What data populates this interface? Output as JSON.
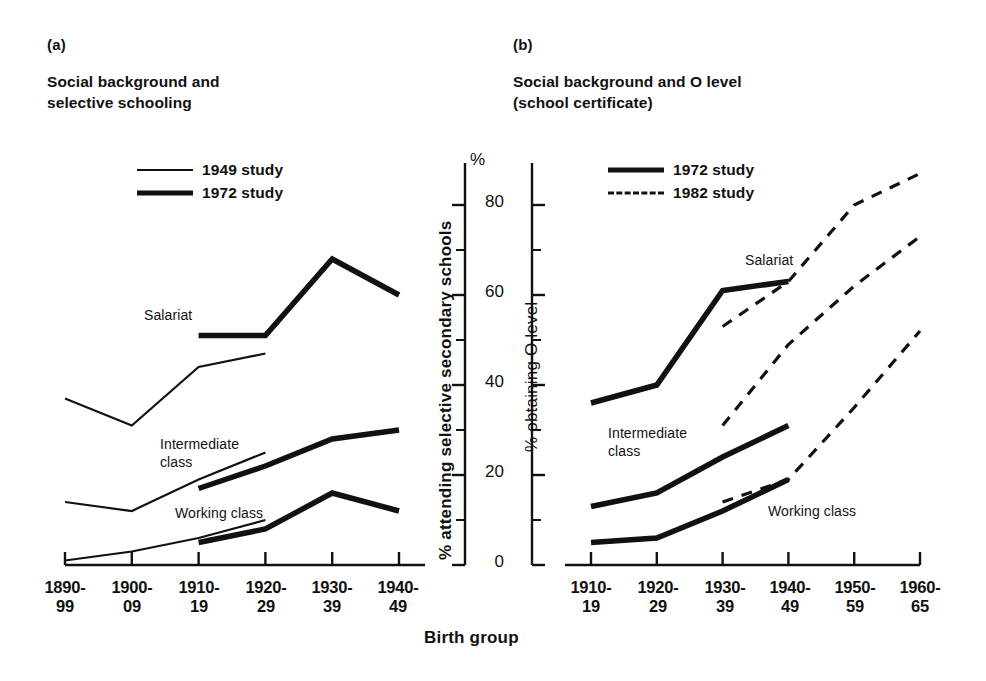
{
  "figure": {
    "shared_xlabel": "Birth group",
    "background": "#ffffff",
    "ink": "#111111"
  },
  "panel_a": {
    "tag": "(a)",
    "title": "Social background and\nselective schooling",
    "legend": [
      {
        "label": "1949 study",
        "style": "thin"
      },
      {
        "label": "1972 study",
        "style": "thick"
      }
    ],
    "series_labels": {
      "salariat": "Salariat",
      "intermediate": "Intermediate\nclass",
      "working": "Working class"
    },
    "ylabel": "% attending selective secondary schools",
    "ytop_symbol": "%",
    "yticks": [
      "0",
      "20",
      "40",
      "60",
      "80"
    ],
    "xticks": [
      "1890-\n99",
      "1900-\n09",
      "1910-\n19",
      "1920-\n29",
      "1930-\n39",
      "1940-\n49"
    ]
  },
  "panel_b": {
    "tag": "(b)",
    "title": "Social background and O level\n(school certificate)",
    "legend": [
      {
        "label": "1972 study",
        "style": "thick"
      },
      {
        "label": "1982 study",
        "style": "dashed"
      }
    ],
    "series_labels": {
      "salariat": "Salariat",
      "intermediate": "Intermediate\nclass",
      "working": "Working class"
    },
    "ylabel": "% obtaining O level",
    "xticks": [
      "1910-\n19",
      "1920-\n29",
      "1930-\n39",
      "1940-\n49",
      "1950-\n59",
      "1960-\n65"
    ]
  },
  "chart_data": [
    {
      "type": "line",
      "panel": "(a)",
      "title": "Social background and selective schooling",
      "xlabel": "Birth group",
      "ylabel": "% attending selective secondary schools",
      "categories": [
        "1890-99",
        "1900-09",
        "1910-19",
        "1920-29",
        "1930-39",
        "1940-49"
      ],
      "ylim": [
        0,
        88
      ],
      "yticks": [
        0,
        20,
        40,
        60,
        80
      ],
      "grid": false,
      "legend": [
        "1949 study",
        "1972 study"
      ],
      "legend_position": "upper-left-inside",
      "series": [
        {
          "name": "Salariat - 1949 study",
          "group": "Salariat",
          "study": "1949",
          "style": "thin-solid",
          "x": [
            "1890-99",
            "1900-09",
            "1910-19",
            "1920-29"
          ],
          "values": [
            37,
            31,
            44,
            47
          ]
        },
        {
          "name": "Salariat - 1972 study",
          "group": "Salariat",
          "study": "1972",
          "style": "thick-solid",
          "x": [
            "1910-19",
            "1920-29",
            "1930-39",
            "1940-49"
          ],
          "values": [
            51,
            51,
            68,
            60
          ]
        },
        {
          "name": "Intermediate class - 1949 study",
          "group": "Intermediate class",
          "study": "1949",
          "style": "thin-solid",
          "x": [
            "1890-99",
            "1900-09",
            "1910-19",
            "1920-29"
          ],
          "values": [
            14,
            12,
            19,
            25
          ]
        },
        {
          "name": "Intermediate class - 1972 study",
          "group": "Intermediate class",
          "study": "1972",
          "style": "thick-solid",
          "x": [
            "1910-19",
            "1920-29",
            "1930-39",
            "1940-49"
          ],
          "values": [
            17,
            22,
            28,
            30
          ]
        },
        {
          "name": "Working class - 1949 study",
          "group": "Working class",
          "study": "1949",
          "style": "thin-solid",
          "x": [
            "1890-99",
            "1900-09",
            "1910-19",
            "1920-29"
          ],
          "values": [
            1,
            3,
            6,
            10
          ]
        },
        {
          "name": "Working class - 1972 study",
          "group": "Working class",
          "study": "1972",
          "style": "thick-solid",
          "x": [
            "1910-19",
            "1920-29",
            "1930-39",
            "1940-49"
          ],
          "values": [
            5,
            8,
            16,
            12
          ]
        }
      ]
    },
    {
      "type": "line",
      "panel": "(b)",
      "title": "Social background and O level (school certificate)",
      "xlabel": "Birth group",
      "ylabel": "% obtaining O level",
      "categories": [
        "1910-19",
        "1920-29",
        "1930-39",
        "1940-49",
        "1950-59",
        "1960-65"
      ],
      "ylim": [
        0,
        88
      ],
      "yticks": [
        0,
        20,
        40,
        60,
        80
      ],
      "grid": false,
      "legend": [
        "1972 study",
        "1982 study"
      ],
      "legend_position": "upper-left-inside",
      "series": [
        {
          "name": "Salariat - 1972 study",
          "group": "Salariat",
          "study": "1972",
          "style": "thick-solid",
          "x": [
            "1910-19",
            "1920-29",
            "1930-39",
            "1940-49"
          ],
          "values": [
            36,
            40,
            61,
            63
          ]
        },
        {
          "name": "Salariat - 1982 study",
          "group": "Salariat",
          "study": "1982",
          "style": "dashed",
          "x": [
            "1930-39",
            "1940-49",
            "1950-59",
            "1960-65"
          ],
          "values": [
            53,
            63,
            80,
            87
          ]
        },
        {
          "name": "Intermediate class - 1972 study",
          "group": "Intermediate class",
          "study": "1972",
          "style": "thick-solid",
          "x": [
            "1910-19",
            "1920-29",
            "1930-39",
            "1940-49"
          ],
          "values": [
            13,
            16,
            24,
            31
          ]
        },
        {
          "name": "Intermediate class - 1982 study",
          "group": "Intermediate class",
          "study": "1982",
          "style": "dashed",
          "x": [
            "1930-39",
            "1940-49",
            "1950-59",
            "1960-65"
          ],
          "values": [
            31,
            49,
            62,
            73
          ]
        },
        {
          "name": "Working class - 1972 study",
          "group": "Working class",
          "study": "1972",
          "style": "thick-solid",
          "x": [
            "1910-19",
            "1920-29",
            "1930-39",
            "1940-49"
          ],
          "values": [
            5,
            6,
            12,
            19
          ]
        },
        {
          "name": "Working class - 1982 study",
          "group": "Working class",
          "study": "1982",
          "style": "dashed",
          "x": [
            "1930-39",
            "1940-49",
            "1950-59",
            "1960-65"
          ],
          "values": [
            14,
            19,
            35,
            52
          ]
        }
      ]
    }
  ]
}
